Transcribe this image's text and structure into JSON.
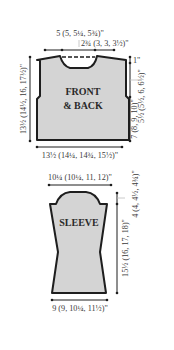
{
  "colors": {
    "piece_fill": "#d4d4d4",
    "outline": "#1e1e1e",
    "text": "#3a3a3a",
    "guide": "#bdbdbd"
  },
  "front_back": {
    "label_line1": "FRONT",
    "label_line2": "& BACK",
    "shoulder_width": "5 (5, 5¼, 5¾)\"",
    "neck_half": "2¾ (3, 3, 3½)\"",
    "neck_depth": "1\"",
    "armhole_depth": "5½ (5½, 6, 6½)\"",
    "side_length": "7 (8, 9, 10)\"",
    "total_length": "13½ (14½, 16, 17½)\"",
    "width": "13½ (14¼, 14¾, 15½)\""
  },
  "sleeve": {
    "label": "SLEEVE",
    "upper_width": "10¼ (10¼, 11, 12)\"",
    "cap_height": "4 (4, 4½, 4¾)\"",
    "length": "15½ (16, 17, 18)\"",
    "cuff_width": "9 (9, 10¼, 11½)\""
  }
}
